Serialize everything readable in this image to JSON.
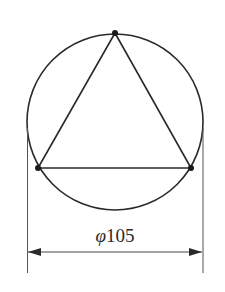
{
  "diagram": {
    "type": "geometry-drawing",
    "stroke_color": "#2a2a2a",
    "dimension_color": "#555555",
    "circle": {
      "cx": 115,
      "cy": 122,
      "r": 88
    },
    "triangle": {
      "vertices": [
        {
          "name": "top",
          "x": 115,
          "y": 33
        },
        {
          "name": "bottom-left",
          "x": 38,
          "y": 168
        },
        {
          "name": "bottom-right",
          "x": 191,
          "y": 168
        }
      ]
    },
    "dimension": {
      "symbol": "φ",
      "value": "105",
      "label": "φ105",
      "left_x": 27,
      "right_x": 203,
      "line_y": 252
    }
  }
}
